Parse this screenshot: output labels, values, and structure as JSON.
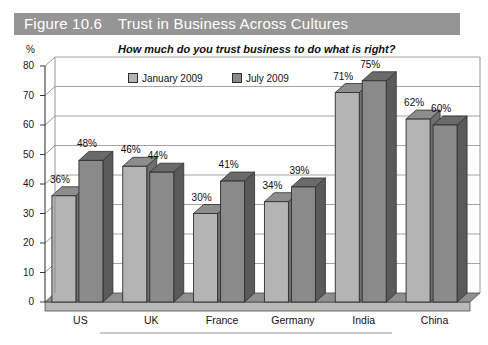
{
  "figure": {
    "number_label": "Figure 10.6",
    "title": "Trust in Business Across Cultures",
    "banner_color": "#959595",
    "caption": ""
  },
  "axis": {
    "unit_label": "%",
    "y_ticks": [
      "80",
      "70",
      "60",
      "50",
      "40",
      "30",
      "20",
      "10",
      "0"
    ]
  },
  "legend": {
    "items": [
      {
        "label": "January 2009",
        "color": "#b4b4b4"
      },
      {
        "label": "July 2009",
        "color": "#8a8a8a"
      }
    ]
  },
  "chart_data": {
    "type": "bar",
    "title": "Trust in Business Across Cultures",
    "subtitle": "How much do you trust business to do what is right?",
    "xlabel": "",
    "ylabel": "%",
    "ylim": [
      0,
      80
    ],
    "ytick_step": 10,
    "grid": true,
    "legend_position": "top-center",
    "categories": [
      "US",
      "UK",
      "France",
      "Germany",
      "India",
      "China"
    ],
    "series": [
      {
        "name": "January 2009",
        "color": "#b4b4b4",
        "values": [
          36,
          46,
          30,
          34,
          71,
          62
        ],
        "labels": [
          "36%",
          "46%",
          "30%",
          "34%",
          "71%",
          "62%"
        ]
      },
      {
        "name": "July 2009",
        "color": "#8a8a8a",
        "values": [
          48,
          44,
          41,
          39,
          75,
          60
        ],
        "labels": [
          "48%",
          "44%",
          "41%",
          "39%",
          "75%",
          "60%"
        ]
      }
    ]
  }
}
